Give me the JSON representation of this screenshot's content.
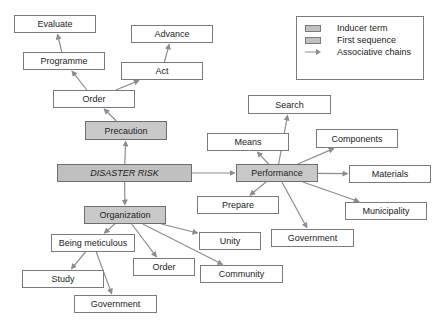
{
  "diagram": {
    "inducer": {
      "id": "disaster_risk",
      "label": "DISASTER RISK"
    },
    "first_sequence": [
      {
        "id": "precaution",
        "label": "Precaution"
      },
      {
        "id": "performance",
        "label": "Performance"
      },
      {
        "id": "organization",
        "label": "Organization"
      }
    ],
    "associative": [
      {
        "id": "order_top",
        "label": "Order"
      },
      {
        "id": "programme",
        "label": "Programme"
      },
      {
        "id": "evaluate",
        "label": "Evaluate"
      },
      {
        "id": "act",
        "label": "Act"
      },
      {
        "id": "advance",
        "label": "Advance"
      },
      {
        "id": "search",
        "label": "Search"
      },
      {
        "id": "means",
        "label": "Means"
      },
      {
        "id": "components",
        "label": "Components"
      },
      {
        "id": "materials",
        "label": "Materials"
      },
      {
        "id": "prepare",
        "label": "Prepare"
      },
      {
        "id": "municipality",
        "label": "Municipality"
      },
      {
        "id": "government_right",
        "label": "Government"
      },
      {
        "id": "unity",
        "label": "Unity"
      },
      {
        "id": "being_meticulous",
        "label": "Being meticulous"
      },
      {
        "id": "order_bottom",
        "label": "Order"
      },
      {
        "id": "community",
        "label": "Community"
      },
      {
        "id": "study",
        "label": "Study"
      },
      {
        "id": "government_bottom",
        "label": "Government"
      }
    ],
    "edges": [
      [
        "disaster_risk",
        "precaution"
      ],
      [
        "disaster_risk",
        "performance"
      ],
      [
        "disaster_risk",
        "organization"
      ],
      [
        "precaution",
        "order_top"
      ],
      [
        "order_top",
        "programme"
      ],
      [
        "programme",
        "evaluate"
      ],
      [
        "order_top",
        "act"
      ],
      [
        "act",
        "advance"
      ],
      [
        "performance",
        "search"
      ],
      [
        "performance",
        "means"
      ],
      [
        "performance",
        "components"
      ],
      [
        "performance",
        "materials"
      ],
      [
        "performance",
        "prepare"
      ],
      [
        "performance",
        "municipality"
      ],
      [
        "performance",
        "government_right"
      ],
      [
        "organization",
        "unity"
      ],
      [
        "organization",
        "being_meticulous"
      ],
      [
        "organization",
        "order_bottom"
      ],
      [
        "organization",
        "community"
      ],
      [
        "being_meticulous",
        "study"
      ],
      [
        "being_meticulous",
        "government_bottom"
      ]
    ],
    "colors": {
      "first_sequence_fill": "#c8c8c8",
      "inducer_fill": "#c0c0c0",
      "arrow": "#8c8c8c",
      "border": "#7a7a7a"
    }
  },
  "legend": {
    "items": [
      {
        "label": "Inducer term",
        "kind": "inducer"
      },
      {
        "label": "First sequence",
        "kind": "first"
      },
      {
        "label": "Associative chains",
        "kind": "arrow"
      }
    ]
  }
}
